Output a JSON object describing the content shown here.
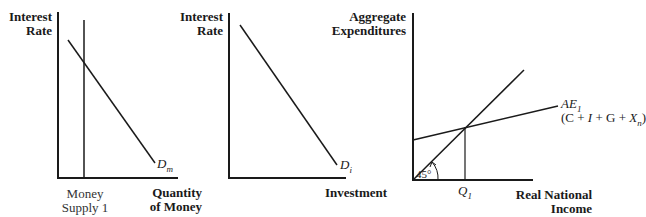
{
  "panels": [
    {
      "id": "money-market",
      "y_axis_label": [
        "Interest",
        "Rate"
      ],
      "x_axis_label": [
        "Quantity",
        "of Money"
      ],
      "vertical_marker_label": [
        "Money",
        "Supply 1"
      ],
      "curve_label": "D",
      "curve_label_sub": "m"
    },
    {
      "id": "investment-demand",
      "y_axis_label": [
        "Interest",
        "Rate"
      ],
      "x_axis_label": [
        "Investment"
      ],
      "curve_label": "D",
      "curve_label_sub": "i"
    },
    {
      "id": "aggregate-expenditures",
      "y_axis_label": [
        "Aggregate",
        "Expenditures"
      ],
      "x_axis_label": [
        "Real National",
        "Income"
      ],
      "ae_label": "AE",
      "ae_label_sub": "1",
      "ae_formula_prefix": "(C + ",
      "ae_formula_i": "I",
      "ae_formula_mid": " + G + ",
      "ae_formula_x": "X",
      "ae_formula_x_sub": "n",
      "ae_formula_suffix": ")",
      "angle_label": "45°",
      "q_label": "Q",
      "q_label_sub": "1"
    }
  ]
}
